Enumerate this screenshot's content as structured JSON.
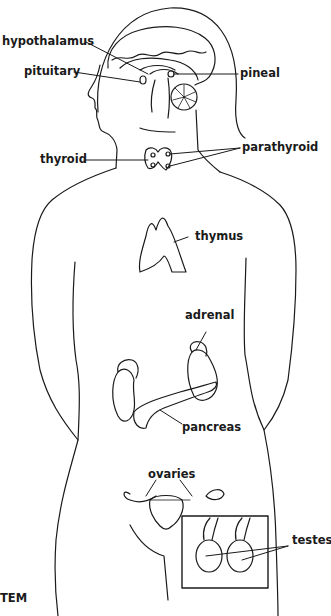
{
  "diagram": {
    "caption_fragment": "TEM",
    "labels": {
      "hypothalamus": "hypothalamus",
      "pituitary": "pituitary",
      "pineal": "pineal",
      "thyroid": "thyroid",
      "parathyroid": "parathyroid",
      "thymus": "thymus",
      "adrenal": "adrenal",
      "pancreas": "pancreas",
      "ovaries": "ovaries",
      "testes": "testes"
    },
    "colors": {
      "line": "#1a1a1a",
      "background": "#ffffff"
    }
  }
}
